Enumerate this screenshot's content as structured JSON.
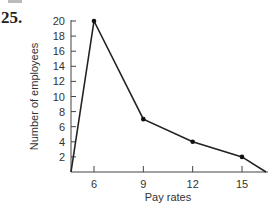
{
  "problem_number": "25.",
  "chart_data": {
    "type": "line",
    "title": "",
    "xlabel": "Pay rates",
    "ylabel": "Number of employees",
    "x_ticks": [
      6,
      9,
      12,
      15
    ],
    "y_ticks": [
      2,
      4,
      6,
      8,
      10,
      12,
      14,
      16,
      18,
      20
    ],
    "ylim": [
      0,
      20
    ],
    "xlim": [
      4.5,
      16.5
    ],
    "grid": false,
    "series": [
      {
        "name": "frequency polygon",
        "x": [
          4.5,
          6,
          9,
          12,
          15,
          16.5
        ],
        "y": [
          0,
          20,
          7,
          4,
          2,
          0
        ]
      }
    ],
    "markers_at": [
      6,
      9,
      12,
      15
    ]
  }
}
